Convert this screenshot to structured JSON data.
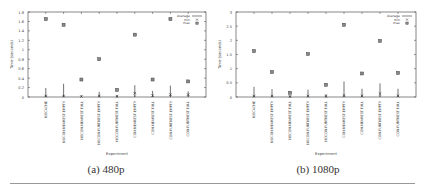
{
  "chart_data": [
    {
      "type": "scatter",
      "panel_label": "(a) 480p",
      "title": "",
      "xlabel": "Experiment",
      "ylabel": "Time (seconds)",
      "ylim": [
        0,
        1.8
      ],
      "yticks": [
        "0",
        "0.2",
        "0.4",
        "0.6",
        "0.8",
        "1",
        "1.2",
        "1.4",
        "1.6",
        "1.8"
      ],
      "ytick_values": [
        0,
        0.2,
        0.4,
        0.6,
        0.8,
        1.0,
        1.2,
        1.4,
        1.6,
        1.8
      ],
      "grid": false,
      "legend_position": "top-right",
      "legend": [
        "Average",
        "min",
        "max"
      ],
      "categories": [
        "NOCACHE",
        "NOCON-NEAREST-EMPTY",
        "NOCON-NEAREST-FULL",
        "NOCON-FURTHEST-EMPTY",
        "NOCON-FURTHEST-FULL",
        "CON-NEAREST-EMPTY",
        "CON-NEAREST-FULL",
        "CON-FURTHEST-EMPTY",
        "CON-FURTHEST-FULL"
      ],
      "series": [
        {
          "name": "Average",
          "marker": "line",
          "values": [
            0.19,
            0.28,
            0.02,
            0.11,
            0.04,
            0.25,
            0.13,
            0.24,
            0.12
          ]
        },
        {
          "name": "min",
          "marker": "x",
          "values": [
            0.02,
            0.02,
            0.01,
            0.02,
            0.01,
            0.08,
            0.03,
            0.05,
            0.05
          ]
        },
        {
          "name": "max",
          "marker": "square",
          "values": [
            1.65,
            1.53,
            0.37,
            0.8,
            0.15,
            1.32,
            0.37,
            1.65,
            0.33
          ]
        }
      ]
    },
    {
      "type": "scatter",
      "panel_label": "(b) 1080p",
      "title": "",
      "xlabel": "Experiment",
      "ylabel": "Time (seconds)",
      "ylim": [
        0,
        3
      ],
      "yticks": [
        "0",
        "0.5",
        "1",
        "1.5",
        "2",
        "2.5",
        "3"
      ],
      "ytick_values": [
        0,
        0.5,
        1.0,
        1.5,
        2.0,
        2.5,
        3.0
      ],
      "grid": false,
      "legend_position": "top-right",
      "legend": [
        "Average",
        "min",
        "max"
      ],
      "categories": [
        "NOCACHE",
        "NOCON-NEAREST-EMPTY",
        "NOCON-NEAREST-FULL",
        "NOCON-FURTHEST-EMPTY",
        "NOCON-FURTHEST-FULL",
        "CON-NEAREST-EMPTY",
        "CON-NEAREST-FULL",
        "CON-FURTHEST-EMPTY",
        "CON-FURTHEST-FULL"
      ],
      "series": [
        {
          "name": "Average",
          "marker": "line",
          "values": [
            0.36,
            0.28,
            0.05,
            0.26,
            0.1,
            0.55,
            0.29,
            0.48,
            0.29
          ]
        },
        {
          "name": "min",
          "marker": "x",
          "values": [
            0.03,
            0.03,
            0.01,
            0.03,
            0.02,
            0.05,
            0.04,
            0.12,
            0.04
          ]
        },
        {
          "name": "max",
          "marker": "square",
          "values": [
            1.62,
            0.88,
            0.15,
            1.52,
            0.43,
            2.55,
            0.83,
            1.98,
            0.85
          ]
        }
      ]
    }
  ],
  "captions": {
    "left": "(a) 480p",
    "right": "(b) 1080p"
  }
}
